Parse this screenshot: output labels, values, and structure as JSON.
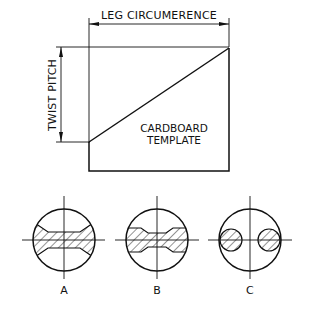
{
  "diagram": {
    "dimension_top": {
      "label": "LEG  CIRCUMERENCE"
    },
    "dimension_left": {
      "label": "TWIST  PITCH"
    },
    "template": {
      "label_line1": "CARDBOARD",
      "label_line2": "TEMPLATE"
    },
    "sections": [
      {
        "id": "A",
        "label": "A",
        "description": "X-shaped cross-section, hatched"
      },
      {
        "id": "B",
        "label": "B",
        "description": "Flat waisted bar cross-section, hatched"
      },
      {
        "id": "C",
        "label": "C",
        "description": "Two separate round hatched cross-sections"
      }
    ],
    "colors": {
      "line": "#111111",
      "background": "#ffffff"
    }
  }
}
